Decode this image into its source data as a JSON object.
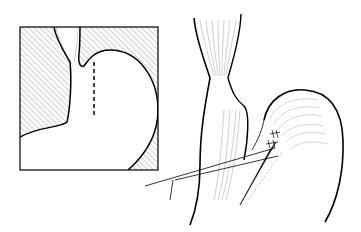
{
  "figure": {
    "type": "surgical-illustration",
    "panels": [
      {
        "id": "inset",
        "description": "boxed inset showing esophagus entering stomach with dashed incision line",
        "hatched_background": true,
        "dashed_line": true
      },
      {
        "id": "main",
        "description": "esophagus and stomach with sutures and instrument lines",
        "sutures": true,
        "instrument_lines": 2
      }
    ],
    "colors": {
      "line": "#000000",
      "background": "#ffffff",
      "hatch": "#555555"
    }
  }
}
